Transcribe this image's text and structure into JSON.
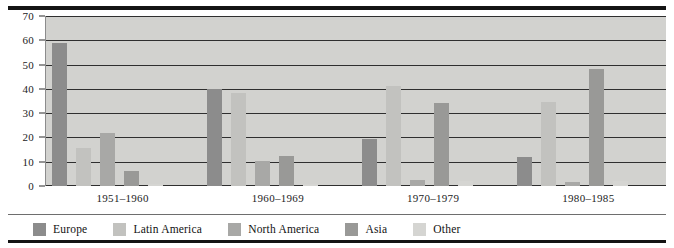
{
  "chart_data": {
    "type": "bar",
    "title": "",
    "subtitle": "",
    "xlabel": "",
    "ylabel": "",
    "categories": [
      "1951–1960",
      "1960–1969",
      "1970–1979",
      "1980–1985"
    ],
    "series": [
      {
        "name": "Europe",
        "color": "#8c8c8c",
        "values": [
          59,
          40,
          19.5,
          12
        ]
      },
      {
        "name": "Latin America",
        "color": "#c2c2bf",
        "values": [
          15.5,
          38.5,
          41,
          34.5
        ]
      },
      {
        "name": "North America",
        "color": "#a8a8a6",
        "values": [
          22,
          10.5,
          2.5,
          1.5
        ]
      },
      {
        "name": "Asia",
        "color": "#999997",
        "values": [
          6,
          12.5,
          34,
          48
        ]
      },
      {
        "name": "Other",
        "color": "#d5d5d2",
        "values": [
          1,
          1,
          2,
          2
        ]
      }
    ],
    "ylim": [
      0,
      70
    ],
    "yticks": [
      0,
      10,
      20,
      30,
      40,
      50,
      60,
      70
    ],
    "ytick_labels": [
      "0",
      "10",
      "20",
      "30",
      "40",
      "50",
      "60",
      "70"
    ],
    "grid": true,
    "legend_position": "bottom",
    "plot_background": "#d2d2cf"
  },
  "legend": {
    "items": [
      {
        "label": "Europe"
      },
      {
        "label": "Latin America"
      },
      {
        "label": "North America"
      },
      {
        "label": "Asia"
      },
      {
        "label": "Other"
      }
    ]
  }
}
